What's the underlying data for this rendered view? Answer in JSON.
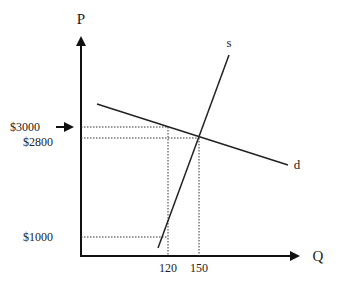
{
  "chart_data": {
    "type": "line",
    "title": "",
    "xlabel": "Q",
    "ylabel": "P",
    "grid": false,
    "colors": {
      "line": "#222222",
      "guide": "#333333",
      "background": "#ffffff"
    },
    "curves": [
      {
        "name": "s",
        "label": "s",
        "kind": "supply"
      },
      {
        "name": "d",
        "label": "d",
        "kind": "demand"
      }
    ],
    "equilibrium": {
      "q": 150,
      "p": 2800
    },
    "annotations": [
      {
        "type": "y-tick",
        "label": "$3000",
        "value": 3000,
        "arrow": true
      },
      {
        "type": "y-tick",
        "label": "$2800",
        "value": 2800,
        "arrow": false
      },
      {
        "type": "y-tick",
        "label": "$1000",
        "value": 1000,
        "arrow": false
      },
      {
        "type": "x-tick",
        "label": "120",
        "value": 120
      },
      {
        "type": "x-tick",
        "label": "150",
        "value": 150
      }
    ],
    "guides": [
      {
        "from": "y:3000",
        "to": "demand at q=120"
      },
      {
        "from": "y:2800",
        "to": "equilibrium"
      },
      {
        "from": "y:1000",
        "to": "supply at q=120"
      },
      {
        "from": "x:120",
        "to": "demand at p=3000"
      },
      {
        "from": "x:150",
        "to": "equilibrium"
      }
    ]
  }
}
